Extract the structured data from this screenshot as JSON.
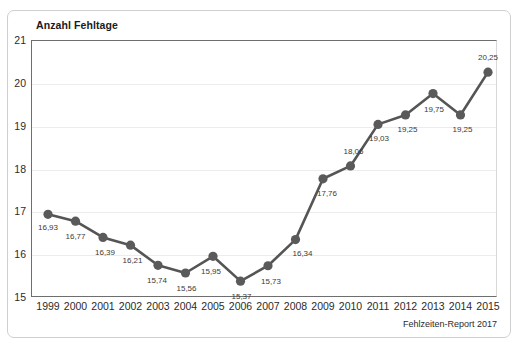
{
  "chart_data": {
    "type": "line",
    "title": "Anzahl Fehltage",
    "xlabel": "",
    "ylabel": "Anzahl Fehltage",
    "ylim": [
      15,
      21
    ],
    "yticks": [
      15,
      16,
      17,
      18,
      19,
      20,
      21
    ],
    "ytick_labels": [
      "15",
      "16",
      "17",
      "18",
      "19",
      "20",
      "21"
    ],
    "grid": true,
    "legend": "none",
    "source_note": "Fehlzeiten-Report 2017",
    "categories": [
      "1999",
      "2000",
      "2001",
      "2002",
      "2003",
      "2004",
      "2005",
      "2006",
      "2007",
      "2008",
      "2009",
      "2010",
      "2011",
      "2012",
      "2013",
      "2014",
      "2015"
    ],
    "values": [
      16.93,
      16.77,
      16.39,
      16.21,
      15.74,
      15.56,
      15.95,
      15.37,
      15.73,
      16.34,
      17.76,
      18.06,
      19.03,
      19.25,
      19.75,
      19.25,
      20.25
    ],
    "value_labels": [
      "16,93",
      "16,77",
      "16,39",
      "16,21",
      "15,74",
      "15,56",
      "15,95",
      "15,37",
      "15,73",
      "16,34",
      "17,76",
      "18,06",
      "19,03",
      "19,25",
      "19,75",
      "19,25",
      "20,25"
    ],
    "label_offsets": [
      {
        "dx": 0,
        "dy": 14
      },
      {
        "dx": 0,
        "dy": 16
      },
      {
        "dx": 2,
        "dy": 16
      },
      {
        "dx": 2,
        "dy": 16
      },
      {
        "dx": -1,
        "dy": 16
      },
      {
        "dx": 1,
        "dy": 16
      },
      {
        "dx": -2,
        "dy": 16
      },
      {
        "dx": 1,
        "dy": 16
      },
      {
        "dx": 3,
        "dy": 16
      },
      {
        "dx": 7,
        "dy": 14
      },
      {
        "dx": 4,
        "dy": 15
      },
      {
        "dx": 3,
        "dy": -14
      },
      {
        "dx": 1,
        "dy": 15
      },
      {
        "dx": 2,
        "dy": 15
      },
      {
        "dx": 1,
        "dy": 16
      },
      {
        "dx": 2,
        "dy": 15
      },
      {
        "dx": 0,
        "dy": -14
      }
    ],
    "line_color": "#555555",
    "marker_color": "#5a5a5a",
    "grid_color": "#ececec",
    "axis_color": "#6e6e6e",
    "text_color": "#2b2b2b"
  }
}
